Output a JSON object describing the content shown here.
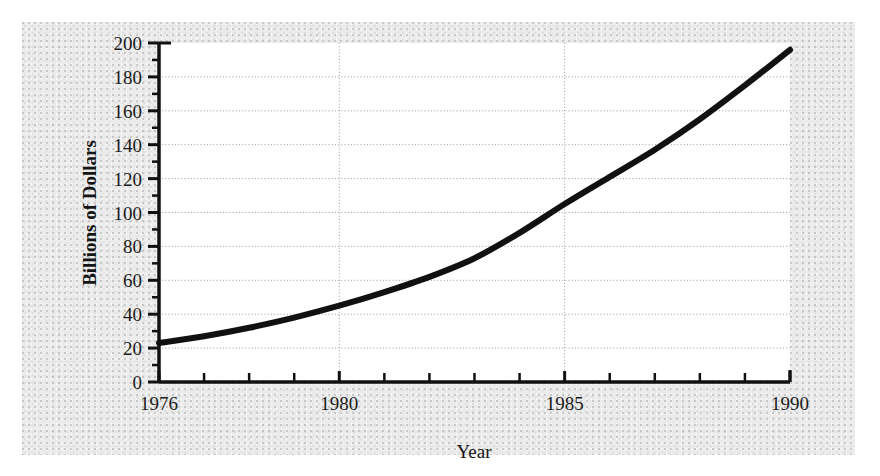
{
  "figure": {
    "background_color": "#ffffff",
    "panel_color": "#ebebeb",
    "plot_background_color": "#ffffff"
  },
  "chart_data": {
    "type": "line",
    "title": "",
    "subtitle": "",
    "xlabel": "Year",
    "ylabel": "Billions of Dollars",
    "xlim": [
      1976,
      1990
    ],
    "ylim": [
      0,
      200
    ],
    "grid": true,
    "grid_style": "dotted",
    "legend": null,
    "legend_position": "none",
    "line_color": "#111111",
    "line_width": 6,
    "x_major_tick_labels": [
      "1976",
      "1980",
      "1985",
      "1990"
    ],
    "x_major_tick_values": [
      1976,
      1980,
      1985,
      1990
    ],
    "x_minor_tick_values": [
      1977,
      1978,
      1979,
      1981,
      1982,
      1983,
      1984,
      1986,
      1987,
      1988,
      1989
    ],
    "x_gridline_values": [
      1980,
      1985
    ],
    "y_major_tick_labels": [
      "0",
      "20",
      "40",
      "60",
      "80",
      "100",
      "120",
      "140",
      "160",
      "180",
      "200"
    ],
    "y_major_tick_values": [
      0,
      20,
      40,
      60,
      80,
      100,
      120,
      140,
      160,
      180,
      200
    ],
    "y_minor_tick_values": [
      10,
      30,
      50,
      70,
      90,
      110,
      130,
      150,
      170,
      190
    ],
    "x": [
      1976,
      1977,
      1978,
      1979,
      1980,
      1981,
      1982,
      1983,
      1984,
      1985,
      1986,
      1987,
      1988,
      1989,
      1990
    ],
    "values": [
      23,
      27,
      32,
      38,
      45,
      53,
      62,
      73,
      88,
      105,
      121,
      137,
      155,
      175,
      196
    ],
    "series": [
      {
        "name": "Billions of Dollars",
        "values": [
          23,
          27,
          32,
          38,
          45,
          53,
          62,
          73,
          88,
          105,
          121,
          137,
          155,
          175,
          196
        ]
      }
    ]
  }
}
